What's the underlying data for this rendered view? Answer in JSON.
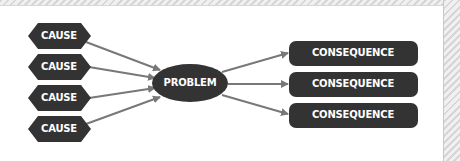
{
  "diagram": {
    "type": "cause-effect flow",
    "colors": {
      "node_fill": "#333333",
      "arrow": "#787878",
      "text": "#ffffff",
      "background": "#ffffff"
    },
    "causes": [
      {
        "label": "CAUSE"
      },
      {
        "label": "CAUSE"
      },
      {
        "label": "CAUSE"
      },
      {
        "label": "CAUSE"
      }
    ],
    "problem": {
      "label": "PROBLEM"
    },
    "consequences": [
      {
        "label": "CONSEQUENCE"
      },
      {
        "label": "CONSEQUENCE"
      },
      {
        "label": "CONSEQUENCE"
      }
    ],
    "edges": [
      {
        "from": "cause-1",
        "to": "problem"
      },
      {
        "from": "cause-2",
        "to": "problem"
      },
      {
        "from": "cause-3",
        "to": "problem"
      },
      {
        "from": "cause-4",
        "to": "problem"
      },
      {
        "from": "problem",
        "to": "consequence-1"
      },
      {
        "from": "problem",
        "to": "consequence-2"
      },
      {
        "from": "problem",
        "to": "consequence-3"
      }
    ]
  }
}
